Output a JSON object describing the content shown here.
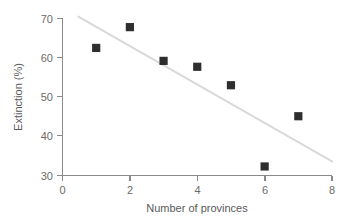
{
  "chart_data": {
    "type": "scatter",
    "title": "",
    "subtitle": "",
    "xlabel": "Number of provinces",
    "ylabel": "Extinction (%)",
    "xlim": [
      0,
      8
    ],
    "ylim": [
      30,
      70
    ],
    "xticks": [
      "0",
      "2",
      "4",
      "6",
      "8"
    ],
    "xtick_values": [
      0,
      2,
      4,
      6,
      8
    ],
    "yticks": [
      "30",
      "40",
      "50",
      "60",
      "70"
    ],
    "ytick_values": [
      30,
      40,
      50,
      60,
      70
    ],
    "grid": false,
    "legend": false,
    "legend_position": "none",
    "marker_shape": "square",
    "marker_color": "#2e2e2e",
    "trendline_color": "#d9d9d9",
    "axis_color": "#8a8a8a",
    "text_color": "#5a5a5a",
    "x": [
      1,
      2,
      3,
      4,
      5,
      6,
      7
    ],
    "y": [
      62.5,
      67.8,
      59.2,
      57.7,
      53.0,
      32.3,
      45.1
    ],
    "points": [
      {
        "x": 1,
        "y": 62.5
      },
      {
        "x": 2,
        "y": 67.8
      },
      {
        "x": 3,
        "y": 59.2
      },
      {
        "x": 4,
        "y": 57.7
      },
      {
        "x": 5,
        "y": 53.0
      },
      {
        "x": 6,
        "y": 32.3
      },
      {
        "x": 7,
        "y": 45.1
      }
    ],
    "series": [
      {
        "name": "Extinction vs provinces",
        "values": [
          62.5,
          67.8,
          59.2,
          57.7,
          53.0,
          32.3,
          45.1
        ]
      }
    ],
    "trendline": {
      "type": "linear-fit",
      "x_start": 0.47,
      "y_start": 70.5,
      "x_end": 8.0,
      "y_end": 33.6
    },
    "annotations": []
  },
  "axis": {
    "x_title": "Number of provinces",
    "y_title": "Extinction (%)",
    "x_tick_0": "0",
    "x_tick_1": "2",
    "x_tick_2": "4",
    "x_tick_3": "6",
    "x_tick_4": "8",
    "y_tick_0": "70",
    "y_tick_1": "60",
    "y_tick_2": "50",
    "y_tick_3": "40",
    "y_tick_4": "30"
  }
}
